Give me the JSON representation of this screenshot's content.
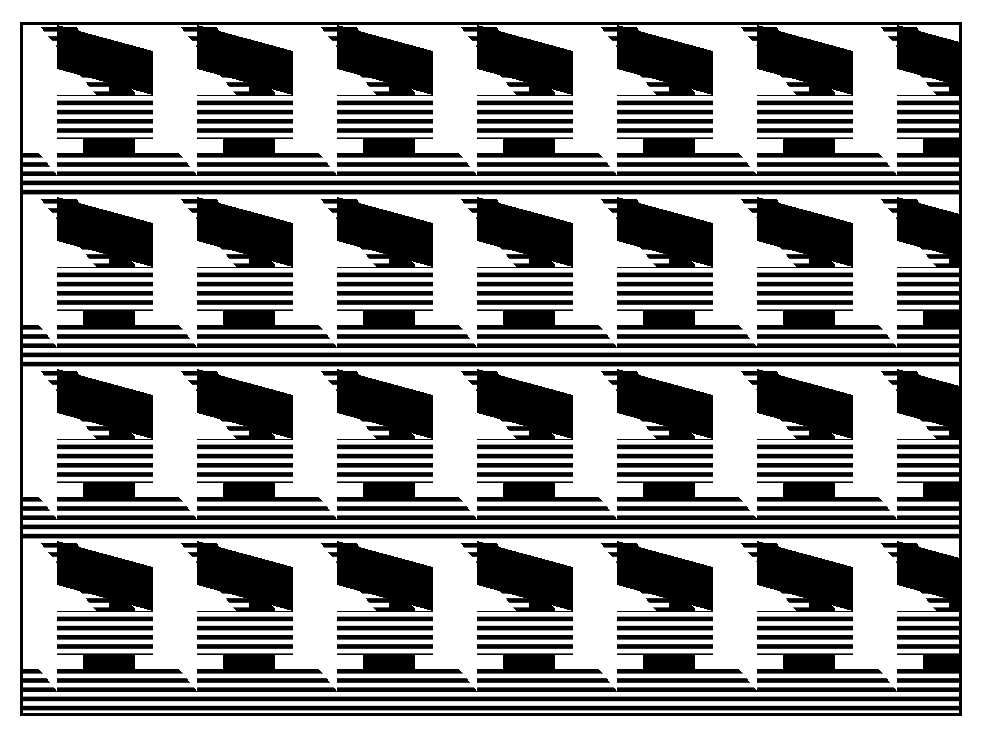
{
  "artwork": {
    "title": "Op-Art Isometric Zigzag Tessellation",
    "medium": "black and white line engraving",
    "description": "Repeating three-dimensional staircase / chevron tessellation rendered in solid black, solid white and horizontally hatched faces",
    "alt_text": "Optical art pattern of interlocking isometric Z-shaped blocks"
  },
  "canvas": {
    "width": 988,
    "height": 739,
    "background": "#ffffff"
  },
  "plate": {
    "left": 20,
    "top": 22,
    "width": 942,
    "height": 694,
    "border_width": 3,
    "border_color": "#000000",
    "fill": "#ffffff"
  },
  "palette": {
    "ink": "#000000",
    "paper": "#ffffff",
    "shadow_face": "#000000",
    "light_face": "#ffffff",
    "hatched_face": "hatch"
  },
  "tile": {
    "period_x": 140,
    "period_y": 172,
    "row_shear_x": 0,
    "offset_x": -54,
    "offset_y": -44,
    "columns": 8,
    "rows": 5
  },
  "hatch": {
    "pitch": 9.2,
    "line_weight": 4.6,
    "orientation": "horizontal",
    "line_color": "#000000",
    "gap_color": "#ffffff"
  },
  "geometry": {
    "step_rise": 86,
    "step_run": 70,
    "bar_thickness": 44,
    "side_depth": 26
  },
  "faces": [
    {
      "name": "top-light-face",
      "shading": "white"
    },
    {
      "name": "front-hatched-face",
      "shading": "hatched"
    },
    {
      "name": "side-shadow-face",
      "shading": "black"
    }
  ]
}
